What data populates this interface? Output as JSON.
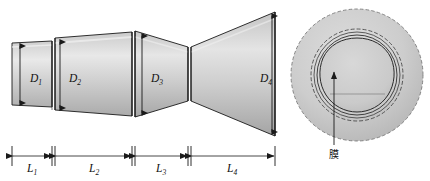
{
  "figure": {
    "background_color": "#ffffff",
    "line_color": "#1a1a1a",
    "body_fill_light": "#e6e6e6",
    "body_fill_mid": "#c8c8c8",
    "body_fill_dark": "#a8a8a8"
  },
  "side_view": {
    "name": "side-profile-view",
    "diameters": [
      {
        "id": "D1",
        "base": "D",
        "sub": "1",
        "label": "D₁",
        "x": 30,
        "y": 79
      },
      {
        "id": "D2",
        "base": "D",
        "sub": "2",
        "label": "D₂",
        "x": 70,
        "y": 79
      },
      {
        "id": "D3",
        "base": "D",
        "sub": "3",
        "label": "D₃",
        "x": 152,
        "y": 79
      },
      {
        "id": "D4",
        "base": "D",
        "sub": "4",
        "label": "D₄",
        "x": 262,
        "y": 79
      }
    ],
    "lengths": [
      {
        "id": "L1",
        "base": "L",
        "sub": "1",
        "label": "L₁",
        "x": 32,
        "y": 169,
        "start": 12,
        "end": 52
      },
      {
        "id": "L2",
        "base": "L",
        "sub": "2",
        "label": "L₂",
        "x": 94,
        "y": 169,
        "start": 55,
        "end": 132
      },
      {
        "id": "L3",
        "base": "L",
        "sub": "3",
        "label": "L₃",
        "x": 161,
        "y": 169,
        "start": 135,
        "end": 188
      },
      {
        "id": "L4",
        "base": "L",
        "sub": "4",
        "label": "L₄",
        "x": 232,
        "y": 169,
        "start": 191,
        "end": 275
      }
    ]
  },
  "end_view": {
    "name": "end-face-view",
    "center_x": 357,
    "center_y": 75,
    "outer_radius": 66,
    "rings": [
      66,
      46,
      43,
      40,
      37
    ],
    "callout": {
      "label": "膜",
      "meaning": "membrane",
      "label_x": 334,
      "label_y": 158,
      "leader_from_x": 334,
      "leader_from_y": 145,
      "leader_to_x": 334,
      "leader_to_y": 70
    }
  }
}
